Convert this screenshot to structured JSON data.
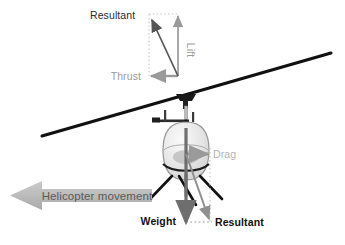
{
  "figure": {
    "background_color": "#ffffff"
  },
  "labels": {
    "resultant_top": "Resultant",
    "lift": "Lift",
    "thrust": "Thrust",
    "drag": "Drag",
    "weight": "Weight",
    "resultant_bottom": "Resultant",
    "movement": "Helicopter movement"
  },
  "colors": {
    "rotor_line": "#111111",
    "vector_gray": "#8f8f8f",
    "vector_dark": "#555555",
    "weight_arrow": "#6e6e6e",
    "movement_fill": "#b9b9b9",
    "movement_text": "#5a5a5a",
    "canopy_fill": "#e9e9e9",
    "canopy_stroke": "#8a8a8a",
    "dotted": "#c4c4c4",
    "text_dark": "#2b2b2b",
    "text_light_gray": "#b4b4b4"
  },
  "vectors": {
    "top_group": [
      {
        "name": "lift",
        "label": "Lift",
        "direction": "up",
        "color": "#9a9a9a"
      },
      {
        "name": "thrust",
        "label": "Thrust",
        "direction": "left",
        "color": "#9a9a9a"
      },
      {
        "name": "resultant",
        "label": "Resultant",
        "direction": "up-left",
        "color": "#6a6a6a"
      }
    ],
    "body_group": [
      {
        "name": "drag",
        "label": "Drag",
        "direction": "right",
        "color": "#9a9a9a"
      },
      {
        "name": "weight",
        "label": "Weight",
        "direction": "down",
        "color": "#6e6e6e"
      },
      {
        "name": "resultant",
        "label": "Resultant",
        "direction": "down-right",
        "color": "#8f8f8f"
      }
    ]
  },
  "movement_arrow": {
    "label": "Helicopter movement",
    "direction": "left",
    "fill": "#b9b9b9"
  }
}
